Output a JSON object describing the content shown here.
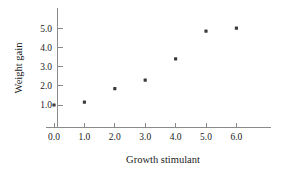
{
  "chart_data": {
    "type": "scatter",
    "title": "",
    "xlabel": "Growth stimulant",
    "ylabel": "Weight gain",
    "x": [
      0.0,
      1.0,
      2.0,
      3.0,
      4.0,
      5.0,
      6.0
    ],
    "values": [
      1.0,
      1.15,
      1.85,
      2.3,
      3.4,
      4.85,
      5.0
    ],
    "points": [
      {
        "x": 0.0,
        "y": 1.0
      },
      {
        "x": 1.0,
        "y": 1.15
      },
      {
        "x": 2.0,
        "y": 1.85
      },
      {
        "x": 3.0,
        "y": 2.3
      },
      {
        "x": 4.0,
        "y": 3.4
      },
      {
        "x": 5.0,
        "y": 4.85
      },
      {
        "x": 6.0,
        "y": 5.0
      }
    ],
    "xlim": [
      0.0,
      7.2
    ],
    "ylim": [
      0.25,
      5.7
    ],
    "xticks": [
      0.0,
      1.0,
      2.0,
      3.0,
      4.0,
      5.0,
      6.0
    ],
    "yticks": [
      1.0,
      2.0,
      3.0,
      4.0,
      5.0
    ],
    "xticklabels": [
      "0.0",
      "1.0",
      "2.0",
      "3.0",
      "4.0",
      "5.0",
      "6.0"
    ],
    "yticklabels": [
      "1.0",
      "2.0",
      "3.0",
      "4.0",
      "5.0"
    ],
    "grid": false,
    "legend": null,
    "marker": "filled-square",
    "marker_color": "#3b3b3b",
    "axis_color": "#8a8a8a"
  },
  "axis": {
    "x_title": "Growth stimulant",
    "y_title": "Weight gain"
  }
}
